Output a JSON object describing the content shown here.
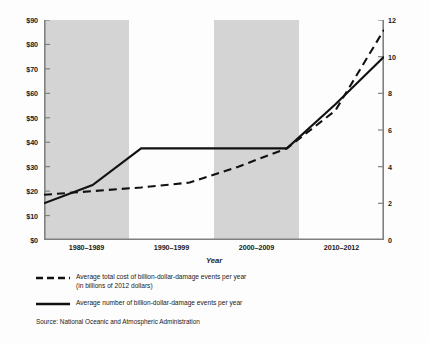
{
  "chart_data": {
    "type": "line",
    "title": "",
    "xlabel": "Year",
    "categories": [
      "1980–1989",
      "1990–1999",
      "2000–2009",
      "2010–2012"
    ],
    "grid": false,
    "legend_position": "below",
    "axes": {
      "left": {
        "label": "",
        "ylim": [
          0,
          90
        ],
        "ticks": [
          0,
          10,
          20,
          30,
          40,
          50,
          60,
          70,
          80,
          90
        ],
        "ticklabels": [
          "$0",
          "$10",
          "$20",
          "$30",
          "$40",
          "$50",
          "$60",
          "$70",
          "$80",
          "$90"
        ]
      },
      "right": {
        "label": "",
        "ylim": [
          0,
          12
        ],
        "ticks": [
          0,
          2,
          4,
          6,
          8,
          10,
          12
        ],
        "ticklabels": [
          "0",
          "2",
          "4",
          "6",
          "8",
          "10",
          "12"
        ]
      }
    },
    "shaded_bands": [
      {
        "category": "1980–1989",
        "color": "#d4d4d4"
      },
      {
        "category": "2000–2009",
        "color": "#d4d4d4"
      }
    ],
    "series": [
      {
        "name": "Average total cost of billion-dollar-damage events per year (in billions of 2012 dollars)",
        "axis": "left",
        "style": "dashed",
        "color": "#111111",
        "x": [
          0,
          0.5,
          1,
          1.5,
          2,
          2.5,
          3,
          3.5
        ],
        "values": [
          18.5,
          20.0,
          21.5,
          23.5,
          30.0,
          37.5,
          53.0,
          86.0
        ]
      },
      {
        "name": "Average number of billion-dollar-damage events per year",
        "axis": "right",
        "style": "solid",
        "color": "#111111",
        "x": [
          0,
          0.5,
          1,
          1.5,
          2,
          2.5,
          3,
          3.5
        ],
        "values": [
          2.0,
          3.0,
          5.0,
          5.0,
          5.0,
          5.0,
          7.4,
          10.0
        ]
      }
    ]
  },
  "legend": {
    "items": [
      {
        "key": "dashed-line-key",
        "label": "Average total cost of billion-dollar-damage events per year\n(in billions of 2012 dollars)"
      },
      {
        "key": "solid-line-key",
        "label": "Average number of billion-dollar-damage events per year"
      }
    ]
  },
  "source": {
    "text": "Source: National Oceanic and Atmospheric Administration"
  },
  "colors": {
    "band": "#d4d4d4",
    "axis": "#808080",
    "line": "#111111",
    "text": "#1a1a1a",
    "background": "#fdfdfd"
  }
}
